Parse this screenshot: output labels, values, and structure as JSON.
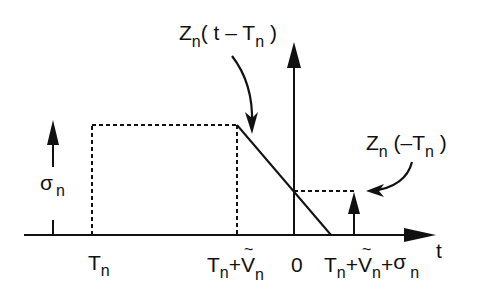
{
  "diagram": {
    "type": "timing-diagram",
    "axis": {
      "label": "t",
      "origin_label": "0"
    },
    "tick_labels": {
      "Tn": {
        "base": "T",
        "sub": "n"
      },
      "Tn_plus_Vn": {
        "base1": "T",
        "sub1": "n",
        "plus": "+",
        "tilde": "~",
        "base2": "V",
        "sub2": "n"
      },
      "Tn_plus_Vn_plus_sigma": {
        "base1": "T",
        "sub1": "n",
        "plus1": "+",
        "tilde": "~",
        "base2": "V",
        "sub2": "n",
        "plus2": "+",
        "base3": "σ",
        "sub3": "n"
      }
    },
    "annotations": {
      "sigma_arrow": {
        "base": "σ",
        "sub": "n"
      },
      "z_shifted": {
        "base": "Z",
        "sub": "n",
        "args_open": "( t – T",
        "args_sub": "n",
        "args_close": " )"
      },
      "z_at_zero": {
        "base": "Z",
        "sub": "n",
        "args_open": " (–T",
        "args_sub": "n",
        "args_close": " )"
      }
    },
    "colors": {
      "ink": "#111111",
      "background": "#ffffff"
    }
  }
}
